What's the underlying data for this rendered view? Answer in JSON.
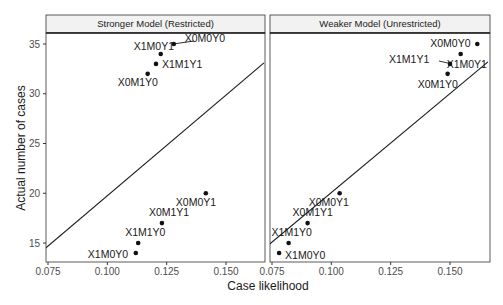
{
  "chart_data": {
    "type": "scatter",
    "title": "",
    "xlabel": "Case likelihood",
    "ylabel": "Actual number of cases",
    "ylim": [
      13,
      36
    ],
    "y_ticks": [
      15,
      20,
      25,
      30,
      35
    ],
    "x_ticks": [
      "0.075",
      "0.100",
      "0.125",
      "0.150"
    ],
    "grid": false,
    "legend": null,
    "panels": [
      {
        "strip": "Stronger Model (Restricted)",
        "xlim": [
          0.074,
          0.166
        ],
        "points": [
          {
            "label": "X0M0Y0",
            "x": 0.128,
            "y": 35
          },
          {
            "label": "X1M0Y1",
            "x": 0.1225,
            "y": 34
          },
          {
            "label": "X1M1Y1",
            "x": 0.1205,
            "y": 33
          },
          {
            "label": "X0M1Y0",
            "x": 0.117,
            "y": 32
          },
          {
            "label": "X0M0Y1",
            "x": 0.1415,
            "y": 20
          },
          {
            "label": "X0M1Y1",
            "x": 0.123,
            "y": 17
          },
          {
            "label": "X1M1Y0",
            "x": 0.113,
            "y": 15
          },
          {
            "label": "X1M0Y0",
            "x": 0.112,
            "y": 14
          }
        ],
        "reference_line": {
          "x1": 0.074,
          "y1": 14.5,
          "x2": 0.166,
          "y2": 33.1
        }
      },
      {
        "strip": "Weaker Model  (Unrestricted)",
        "xlim": [
          0.074,
          0.166
        ],
        "points": [
          {
            "label": "X0M0Y0",
            "x": 0.1615,
            "y": 35
          },
          {
            "label": "X1M0Y1",
            "x": 0.1545,
            "y": 34
          },
          {
            "label": "X1M1Y1",
            "x": 0.15,
            "y": 33
          },
          {
            "label": "X0M1Y0",
            "x": 0.149,
            "y": 32
          },
          {
            "label": "X0M0Y1",
            "x": 0.1035,
            "y": 20
          },
          {
            "label": "X0M1Y1",
            "x": 0.09,
            "y": 17
          },
          {
            "label": "X1M1Y0",
            "x": 0.082,
            "y": 15
          },
          {
            "label": "X1M0Y0",
            "x": 0.078,
            "y": 14
          }
        ],
        "reference_line": {
          "x1": 0.074,
          "y1": 14.9,
          "x2": 0.166,
          "y2": 33.2
        }
      }
    ]
  }
}
